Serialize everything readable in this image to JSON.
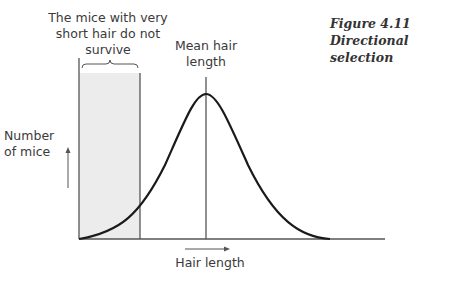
{
  "figure": {
    "number": "Figure 4.11",
    "title": "Directional selection"
  },
  "labels": {
    "excluded_region": "The mice with very short hair do not survive",
    "excluded_line1": "The mice with very",
    "excluded_line2": "short hair do not",
    "excluded_line3": "survive",
    "mean_line1": "Mean hair",
    "mean_line2": "length",
    "y_axis_line1": "Number",
    "y_axis_line2": "of mice",
    "x_axis": "Hair length"
  },
  "colors": {
    "shaded_region": "#ececec",
    "curve": "#1a1a1a",
    "lines": "#555555"
  }
}
